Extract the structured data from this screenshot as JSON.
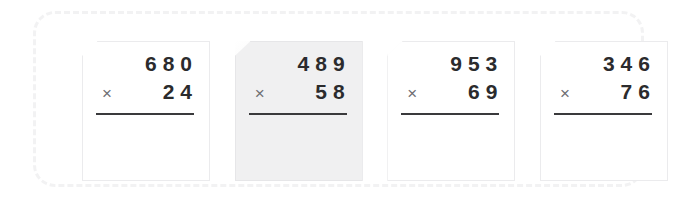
{
  "worksheet": {
    "background_color": "#ffffff",
    "frame_border_color": "#f2f2f3",
    "problems": [
      {
        "multiplicand": "680",
        "operator": "×",
        "multiplier": "24",
        "answer": "",
        "tinted": false
      },
      {
        "multiplicand": "489",
        "operator": "×",
        "multiplier": "58",
        "answer": "",
        "tinted": true
      },
      {
        "multiplicand": "953",
        "operator": "×",
        "multiplier": "69",
        "answer": "",
        "tinted": false
      },
      {
        "multiplicand": "346",
        "operator": "×",
        "multiplier": "76",
        "answer": "",
        "tinted": false
      }
    ],
    "colors": {
      "digit": "#2b2b2d",
      "operator": "#6e6e72",
      "rule": "#3a3a3c",
      "card_border": "#ebebed",
      "card_tint": "#f0f0f1"
    }
  }
}
